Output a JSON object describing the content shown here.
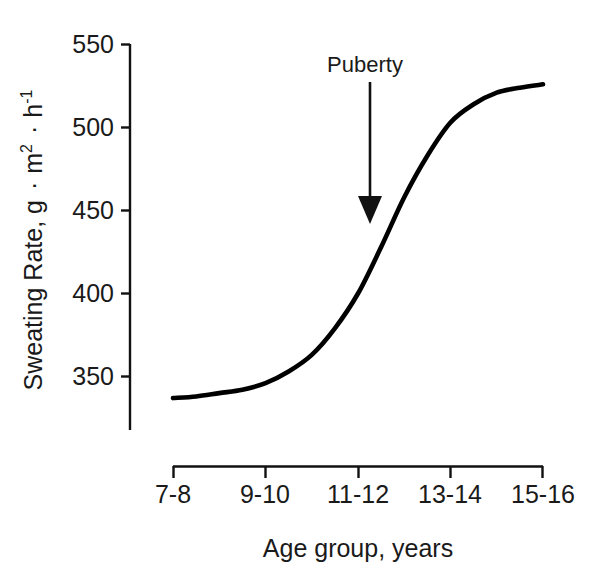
{
  "chart_data": {
    "type": "line",
    "title": "",
    "subtitle": "",
    "xlabel": "Age group,  years",
    "ylabel": "Sweating Rate, g · m² · h⁻¹",
    "ylabel_parts": {
      "main": "Sweating Rate, g",
      "sep1": "·",
      "unit1": "m",
      "unit1_sup": "2",
      "sep2": "·",
      "unit2": "h",
      "unit2_sup": "-1"
    },
    "categories": [
      "7-8",
      "9-10",
      "11-12",
      "13-14",
      "15-16"
    ],
    "x": [
      1,
      2,
      3,
      4,
      5
    ],
    "values": [
      337,
      345,
      400,
      505,
      526
    ],
    "series": [
      {
        "name": "Sweating rate",
        "values": [
          337,
          345,
          400,
          505,
          526
        ]
      }
    ],
    "curve_points": [
      {
        "x": 1.0,
        "y": 337
      },
      {
        "x": 1.25,
        "y": 338
      },
      {
        "x": 1.5,
        "y": 340
      },
      {
        "x": 1.75,
        "y": 342
      },
      {
        "x": 2.0,
        "y": 346
      },
      {
        "x": 2.25,
        "y": 353
      },
      {
        "x": 2.5,
        "y": 363
      },
      {
        "x": 2.75,
        "y": 379
      },
      {
        "x": 3.0,
        "y": 400
      },
      {
        "x": 3.25,
        "y": 428
      },
      {
        "x": 3.5,
        "y": 458
      },
      {
        "x": 3.75,
        "y": 483
      },
      {
        "x": 4.0,
        "y": 503
      },
      {
        "x": 4.25,
        "y": 514
      },
      {
        "x": 4.5,
        "y": 521
      },
      {
        "x": 4.75,
        "y": 524
      },
      {
        "x": 5.0,
        "y": 526
      }
    ],
    "ylim": [
      320,
      550
    ],
    "xlim": [
      1,
      5
    ],
    "yticks": [
      350,
      400,
      450,
      500,
      550
    ],
    "ytick_labels": [
      "350",
      "400",
      "450",
      "500",
      "550"
    ],
    "xtick_labels": [
      "7-8",
      "9-10",
      "11-12",
      "13-14",
      "15-16"
    ],
    "grid": false,
    "legend": false,
    "legend_position": "none",
    "annotations": [
      {
        "label": "Puberty",
        "type": "arrow-down",
        "x_category": "11-12",
        "points_to_y": 440
      }
    ],
    "colors": {
      "curve": "#000000",
      "axis": "#111111",
      "text": "#1a1a1a",
      "background": "#ffffff"
    }
  }
}
